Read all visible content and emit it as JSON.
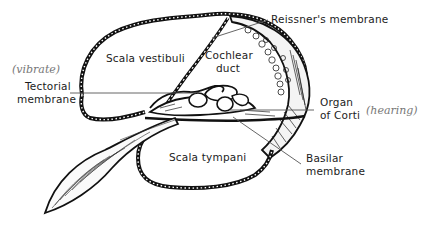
{
  "diagram": {
    "labels": {
      "scala_vestibuli": "Scala vestibuli",
      "cochlear_duct_line1": "Cochlear",
      "cochlear_duct_line2": "duct",
      "reissners_membrane": "Reissner's membrane",
      "tectorial_membrane_line1": "Tectorial",
      "tectorial_membrane_line2": "membrane",
      "organ_of_corti_line1": "Organ",
      "organ_of_corti_line2": "of Corti",
      "scala_tympani": "Scala tympani",
      "basilar_membrane_line1": "Basilar",
      "basilar_membrane_line2": "membrane"
    },
    "annotations": {
      "vibrate": "(vibrate)",
      "hearing": "(hearing)"
    },
    "colors": {
      "ink": "#111111",
      "label_text": "#1c1c1c",
      "pencil": "#777777",
      "background": "#ffffff"
    }
  }
}
